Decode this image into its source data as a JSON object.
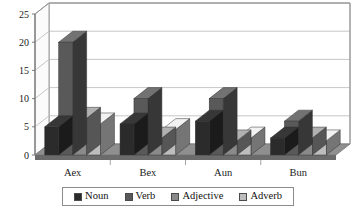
{
  "chart_data": {
    "type": "bar",
    "title": "",
    "subtitle": "",
    "xlabel": "",
    "ylabel": "",
    "ylim": [
      0,
      25
    ],
    "yticks": [
      0,
      5,
      10,
      15,
      20,
      25
    ],
    "ytick_labels": [
      "0",
      "5",
      "10",
      "15",
      "20",
      "25"
    ],
    "grid": true,
    "three_d": true,
    "legend_position": "bottom",
    "categories": [
      "Aex",
      "Bex",
      "Aun",
      "Bun"
    ],
    "series": [
      {
        "name": "Noun",
        "color": "#2b2b2b",
        "values": [
          5,
          5.5,
          6,
          3
        ]
      },
      {
        "name": "Verb",
        "color": "#595959",
        "values": [
          20,
          10,
          10,
          6
        ]
      },
      {
        "name": "Adjective",
        "color": "#8a8a8a",
        "values": [
          6.5,
          3,
          2.5,
          3
        ]
      },
      {
        "name": "Adverb",
        "color": "#bdbdbd",
        "values": [
          5.5,
          4.5,
          3,
          2.5
        ]
      }
    ]
  },
  "legend": {
    "items": [
      {
        "label": "Noun"
      },
      {
        "label": "Verb"
      },
      {
        "label": "Adjective"
      },
      {
        "label": "Adverb"
      }
    ]
  },
  "colors": {
    "background": "#ffffff",
    "gridline": "#b8b8b8",
    "frame": "#9a9a9a",
    "floor": "#8f8f8f",
    "floor_dark": "#6b6b6b",
    "text": "#1a1a1a"
  }
}
